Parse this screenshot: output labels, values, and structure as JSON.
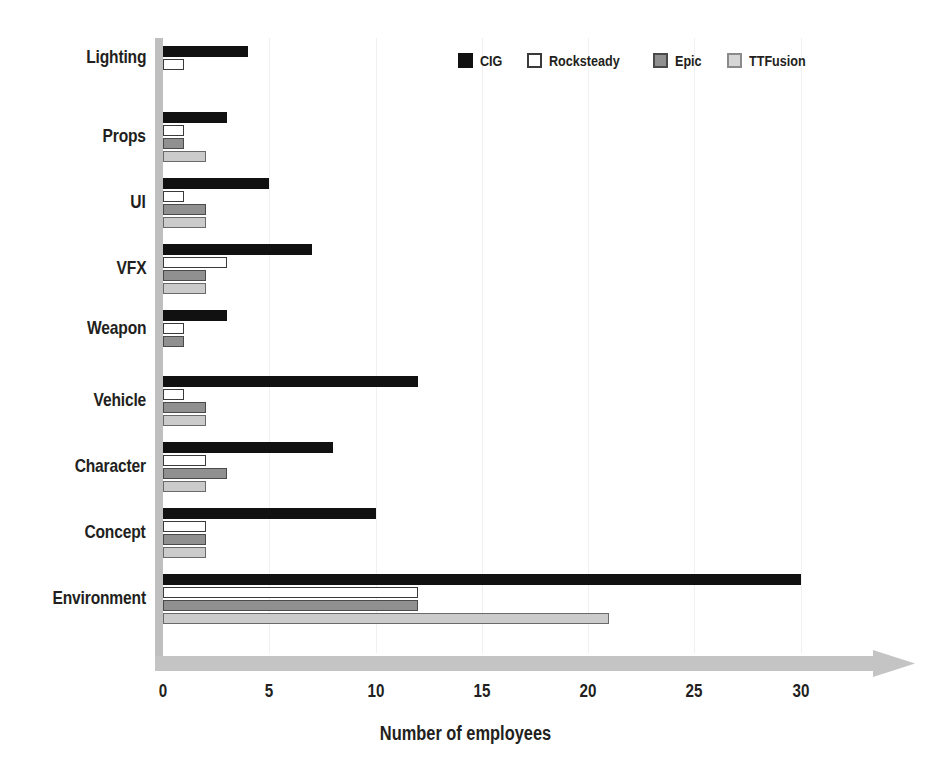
{
  "chart_data": {
    "type": "bar",
    "orientation": "horizontal",
    "title": "",
    "xlabel": "Number of employees",
    "ylabel": "",
    "xlim": [
      0,
      31.5
    ],
    "xticks": [
      0,
      5,
      10,
      15,
      20,
      25,
      30
    ],
    "xtick_labels": [
      "0",
      "5",
      "10",
      "15",
      "20",
      "25",
      "30"
    ],
    "grid": true,
    "grid_axis": "x",
    "legend_position": "top-right",
    "categories": [
      "Lighting",
      "Props",
      "UI",
      "VFX",
      "Weapon",
      "Vehicle",
      "Character",
      "Concept",
      "Environment"
    ],
    "series": [
      {
        "name": "CIG",
        "color": "#111111",
        "values": [
          4,
          3,
          5,
          7,
          3,
          12,
          8,
          10,
          30
        ]
      },
      {
        "name": "Rocksteady",
        "color": "#ffffff",
        "values": [
          1,
          1,
          1,
          3,
          1,
          1,
          2,
          2,
          12
        ]
      },
      {
        "name": "Epic",
        "color": "#909090",
        "values": [
          0,
          1,
          2,
          2,
          1,
          2,
          3,
          2,
          12
        ]
      },
      {
        "name": "TTFusion",
        "color": "#cbcbcb",
        "values": [
          0,
          2,
          2,
          2,
          0,
          2,
          2,
          2,
          21
        ]
      }
    ]
  },
  "legend": {
    "items": [
      {
        "label": "CIG"
      },
      {
        "label": "Rocksteady"
      },
      {
        "label": "Epic"
      },
      {
        "label": "TTFusion"
      }
    ]
  },
  "axis": {
    "x_title": "Number of employees"
  },
  "colors": {
    "cig": "#111111",
    "rocksteady": "#ffffff",
    "epic": "#909090",
    "ttfusion": "#cbcbcb",
    "axis_band": "#bfbfbf",
    "grid": "#f0f0f0",
    "text": "#231f20"
  }
}
